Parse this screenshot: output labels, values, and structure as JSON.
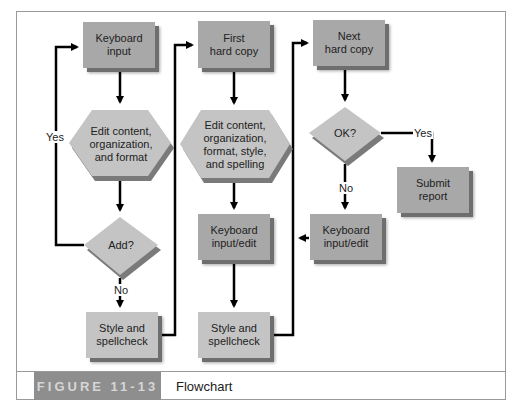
{
  "figure": {
    "label": "FIGURE 11-13",
    "title": "Flowchart"
  },
  "colors": {
    "box_fill": "#a8a8a8",
    "shape_fill": "#c4c4c4",
    "shadow": "#6e6e6e",
    "line": "#000000",
    "caption_band": "#8e8e8e",
    "caption_text": "#d6d6d6"
  },
  "nodes": {
    "keyboard_input": "Keyboard\ninput",
    "edit_content_1": "Edit content,\norganization,\nand format",
    "add_decision": "Add?",
    "style_spellcheck_1": "Style and\nspellcheck",
    "first_hard_copy": "First\nhard copy",
    "edit_content_2": "Edit content,\norganization,\nformat, style,\nand spelling",
    "keyboard_input_edit_1": "Keyboard\ninput/edit",
    "style_spellcheck_2": "Style and\nspellcheck",
    "next_hard_copy": "Next\nhard copy",
    "ok_decision": "OK?",
    "submit_report": "Submit\nreport",
    "keyboard_input_edit_2": "Keyboard\ninput/edit"
  },
  "edge_labels": {
    "add_yes": "Yes",
    "add_no": "No",
    "ok_yes": "Yes",
    "ok_no": "No"
  }
}
